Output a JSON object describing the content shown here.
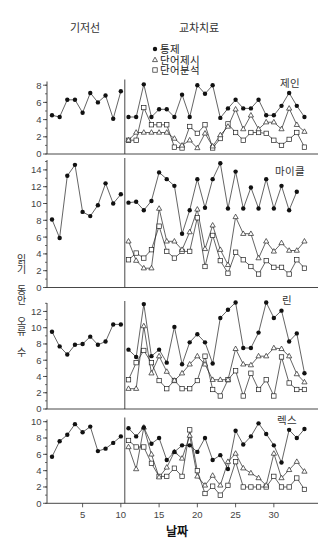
{
  "header": {
    "baseline_label": "기저선",
    "treatment_label": "교차치료"
  },
  "legend": {
    "items": [
      {
        "marker": "filled-circle",
        "label": "통제"
      },
      {
        "marker": "open-triangle",
        "label": "단어제시"
      },
      {
        "marker": "open-square",
        "label": "단어분석"
      }
    ]
  },
  "axes": {
    "ylabel": "읽기 동안 오류 수",
    "xlabel": "날짜",
    "xticks": [
      5,
      10,
      15,
      20,
      25,
      30
    ]
  },
  "colors": {
    "line": "#222222",
    "marker": "#111111",
    "axis": "#333333"
  },
  "chart_data": [
    {
      "type": "line",
      "title": "제인",
      "xlabel": "날짜",
      "ylabel": "읽기 동안 오류 수",
      "phases": [
        "기저선",
        "교차치료"
      ],
      "phase_change_after": 10,
      "x": [
        1,
        2,
        3,
        4,
        5,
        6,
        7,
        8,
        9,
        10,
        11,
        12,
        13,
        14,
        15,
        16,
        17,
        18,
        19,
        20,
        21,
        22,
        23,
        24,
        25,
        26,
        27,
        28,
        29,
        30,
        31,
        32,
        33,
        34
      ],
      "ylim": [
        0,
        8
      ],
      "yticks": [
        0,
        2,
        4,
        6,
        8
      ],
      "grid": false,
      "legend_position": "top-center",
      "series": [
        {
          "name": "통제",
          "marker": "filled-circle",
          "values": [
            4.5,
            4.3,
            6.3,
            6.3,
            4.8,
            7.1,
            6.0,
            6.8,
            4.1,
            7.3,
            4.3,
            4.3,
            8.1,
            4.3,
            5.2,
            5.2,
            4.3,
            6.9,
            4.3,
            8.0,
            7.0,
            8.0,
            4.2,
            5.3,
            6.3,
            5.3,
            5.3,
            6.3,
            4.5,
            4.5,
            5.6,
            7.1,
            5.6,
            4.3
          ]
        },
        {
          "name": "단어제시",
          "marker": "open-triangle",
          "values": [
            null,
            null,
            null,
            null,
            null,
            null,
            null,
            null,
            null,
            null,
            1.6,
            2.5,
            2.5,
            2.5,
            2.5,
            2.5,
            1.8,
            1.0,
            1.6,
            0.7,
            2.4,
            0.9,
            2.2,
            3.2,
            5.2,
            2.9,
            4.5,
            2.9,
            3.7,
            3.7,
            2.9,
            5.3,
            3.4,
            2.6
          ]
        },
        {
          "name": "단어분석",
          "marker": "open-square",
          "values": [
            null,
            null,
            null,
            null,
            null,
            null,
            null,
            null,
            null,
            null,
            1.6,
            1.6,
            5.4,
            3.4,
            3.4,
            3.4,
            0.8,
            0.7,
            3.2,
            2.4,
            3.4,
            0.7,
            1.8,
            3.5,
            2.5,
            1.6,
            2.5,
            2.5,
            2.4,
            1.6,
            1.0,
            1.7,
            2.5,
            0.8
          ]
        }
      ]
    },
    {
      "type": "line",
      "title": "마이클",
      "xlabel": "날짜",
      "ylabel": "읽기 동안 오류 수",
      "phases": [
        "기저선",
        "교차치료"
      ],
      "phase_change_after": 10,
      "x": [
        1,
        2,
        3,
        4,
        5,
        6,
        7,
        8,
        9,
        10,
        11,
        12,
        13,
        14,
        15,
        16,
        17,
        18,
        19,
        20,
        21,
        22,
        23,
        24,
        25,
        26,
        27,
        28,
        29,
        30,
        31,
        32,
        33,
        34
      ],
      "ylim": [
        0,
        15
      ],
      "yticks": [
        0,
        2,
        4,
        6,
        8,
        10,
        12,
        14
      ],
      "grid": false,
      "series": [
        {
          "name": "통제",
          "marker": "filled-circle",
          "values": [
            8.1,
            5.9,
            13.3,
            14.6,
            9.0,
            8.5,
            9.8,
            12.4,
            10.0,
            11.1,
            10.1,
            10.2,
            9.2,
            10.3,
            13.7,
            12.9,
            12.1,
            6.4,
            9.2,
            12.9,
            9.5,
            12.9,
            14.8,
            9.4,
            13.8,
            9.4,
            11.9,
            9.4,
            12.9,
            9.4,
            12.1,
            9.2,
            11.4,
            null
          ]
        },
        {
          "name": "단어제시",
          "marker": "open-triangle",
          "values": [
            null,
            null,
            null,
            null,
            null,
            null,
            null,
            null,
            null,
            null,
            5.5,
            3.2,
            2.3,
            2.3,
            9.4,
            5.5,
            5.5,
            4.5,
            6.6,
            9.3,
            4.6,
            7.4,
            4.5,
            2.7,
            8.4,
            6.4,
            6.4,
            3.5,
            5.5,
            4.3,
            5.3,
            4.4,
            4.4,
            5.5
          ]
        },
        {
          "name": "단어분석",
          "marker": "open-square",
          "values": [
            null,
            null,
            null,
            null,
            null,
            null,
            null,
            null,
            null,
            null,
            3.3,
            4.1,
            3.5,
            4.5,
            7.3,
            4.3,
            3.5,
            4.3,
            4.3,
            8.3,
            2.5,
            6.2,
            3.2,
            1.7,
            4.2,
            3.3,
            2.5,
            1.6,
            3.2,
            2.4,
            2.4,
            1.6,
            3.3,
            2.3
          ]
        }
      ]
    },
    {
      "type": "line",
      "title": "린",
      "xlabel": "날짜",
      "ylabel": "읽기 동안 오류 수",
      "phases": [
        "기저선",
        "교차치료"
      ],
      "phase_change_after": 10,
      "x": [
        1,
        2,
        3,
        4,
        5,
        6,
        7,
        8,
        9,
        10,
        11,
        12,
        13,
        14,
        15,
        16,
        17,
        18,
        19,
        20,
        21,
        22,
        23,
        24,
        25,
        26,
        27,
        28,
        29,
        30,
        31,
        32,
        33,
        34
      ],
      "ylim": [
        0,
        13
      ],
      "yticks": [
        0,
        2,
        4,
        6,
        8,
        10,
        12
      ],
      "grid": false,
      "series": [
        {
          "name": "통제",
          "marker": "filled-circle",
          "values": [
            9.5,
            7.7,
            6.7,
            7.9,
            8.0,
            8.9,
            7.9,
            8.3,
            10.4,
            10.4,
            7.3,
            6.4,
            12.9,
            6.5,
            7.3,
            5.7,
            10.1,
            5.5,
            8.2,
            9.2,
            8.2,
            5.6,
            11.2,
            12.2,
            13.1,
            7.5,
            7.5,
            9.4,
            13.1,
            11.2,
            12.1,
            8.3,
            9.3,
            4.4
          ]
        },
        {
          "name": "단어제시",
          "marker": "open-triangle",
          "values": [
            null,
            null,
            null,
            null,
            null,
            null,
            null,
            null,
            null,
            null,
            2.5,
            2.5,
            10.2,
            4.4,
            6.5,
            4.6,
            3.5,
            4.4,
            5.5,
            6.5,
            5.5,
            3.6,
            3.6,
            3.6,
            7.4,
            5.5,
            5.4,
            6.5,
            6.5,
            7.5,
            7.4,
            6.5,
            4.3,
            3.3
          ]
        },
        {
          "name": "단어분석",
          "marker": "open-square",
          "values": [
            null,
            null,
            null,
            null,
            null,
            null,
            null,
            null,
            null,
            null,
            3.6,
            5.7,
            7.2,
            5.7,
            3.5,
            2.5,
            3.5,
            2.5,
            2.5,
            3.5,
            6.5,
            2.4,
            1.6,
            3.6,
            4.7,
            1.6,
            4.4,
            2.4,
            3.6,
            1.6,
            6.4,
            3.2,
            2.4,
            2.4
          ]
        }
      ]
    },
    {
      "type": "line",
      "title": "렉스",
      "xlabel": "날짜",
      "ylabel": "읽기 동안 오류 수",
      "phases": [
        "기저선",
        "교차치료"
      ],
      "phase_change_after": 10,
      "x": [
        1,
        2,
        3,
        4,
        5,
        6,
        7,
        8,
        9,
        10,
        11,
        12,
        13,
        14,
        15,
        16,
        17,
        18,
        19,
        20,
        21,
        22,
        23,
        24,
        25,
        26,
        27,
        28,
        29,
        30,
        31,
        32,
        33,
        34
      ],
      "ylim": [
        0,
        10
      ],
      "yticks": [
        0,
        2,
        4,
        6,
        8,
        10
      ],
      "xticks": [
        5,
        10,
        15,
        20,
        25,
        30
      ],
      "grid": false,
      "series": [
        {
          "name": "통제",
          "marker": "filled-circle",
          "values": [
            5.7,
            7.6,
            8.4,
            9.7,
            8.7,
            9.4,
            6.4,
            6.7,
            7.4,
            8.2,
            9.2,
            8.2,
            9.3,
            7.3,
            8.0,
            5.3,
            6.3,
            7.1,
            7.1,
            6.3,
            8.0,
            5.3,
            5.9,
            4.2,
            8.9,
            7.2,
            8.2,
            9.8,
            8.5,
            7.1,
            5.0,
            9.0,
            8.0,
            9.1
          ]
        },
        {
          "name": "단어제시",
          "marker": "open-triangle",
          "values": [
            null,
            null,
            null,
            null,
            null,
            null,
            null,
            null,
            null,
            null,
            6.9,
            4.2,
            9.3,
            6.0,
            3.2,
            4.4,
            6.3,
            5.5,
            8.3,
            3.3,
            2.2,
            3.4,
            2.2,
            5.1,
            6.1,
            4.3,
            3.7,
            3.1,
            2.2,
            6.1,
            3.1,
            4.1,
            5.1,
            3.9
          ]
        },
        {
          "name": "단어분석",
          "marker": "open-square",
          "values": [
            null,
            null,
            null,
            null,
            null,
            null,
            null,
            null,
            null,
            null,
            7.7,
            6.9,
            6.9,
            4.9,
            3.3,
            3.3,
            4.3,
            3.3,
            9.0,
            4.0,
            1.2,
            2.1,
            1.0,
            2.2,
            5.1,
            2.0,
            2.0,
            2.0,
            2.0,
            3.3,
            2.0,
            2.0,
            3.1,
            1.7
          ]
        }
      ]
    }
  ]
}
